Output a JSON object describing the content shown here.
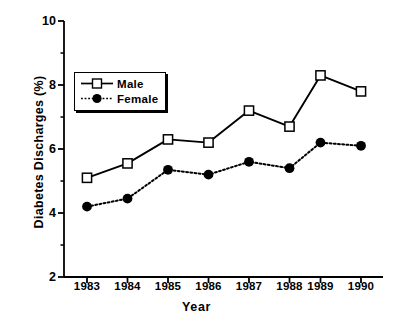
{
  "chart_data": {
    "type": "line",
    "title": "",
    "xlabel": "Year",
    "ylabel": "Diabetes Discharges (%)",
    "categories": [
      "1983",
      "1984",
      "1985",
      "1986",
      "1987",
      "1988",
      "1989",
      "1990"
    ],
    "ylim": [
      2,
      10
    ],
    "yticks": [
      2,
      4,
      6,
      8,
      10
    ],
    "yticklabels": [
      "2",
      "4",
      "6",
      "8",
      "10"
    ],
    "yminorticks": [
      3,
      5,
      7,
      9
    ],
    "grid": false,
    "legend_position": "upper left inside",
    "series": [
      {
        "name": "Male",
        "marker": "open-square",
        "linestyle": "solid",
        "color": "#000000",
        "values": [
          5.1,
          5.55,
          6.3,
          6.2,
          7.2,
          6.7,
          8.3,
          7.8
        ]
      },
      {
        "name": "Female",
        "marker": "filled-circle",
        "linestyle": "dotted",
        "color": "#000000",
        "values": [
          4.2,
          4.45,
          5.35,
          5.2,
          5.6,
          5.4,
          6.2,
          6.1
        ]
      }
    ]
  }
}
